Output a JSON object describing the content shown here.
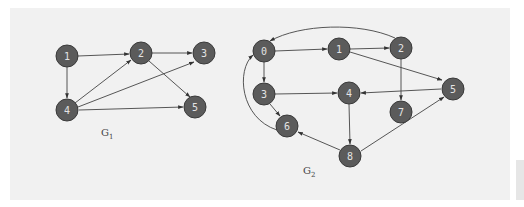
{
  "graphs": [
    {
      "id": "G1",
      "label": "G",
      "subscript": "1",
      "nodes": [
        {
          "id": "1",
          "x": 67,
          "y": 56
        },
        {
          "id": "2",
          "x": 141,
          "y": 53
        },
        {
          "id": "3",
          "x": 204,
          "y": 53
        },
        {
          "id": "4",
          "x": 67,
          "y": 110
        },
        {
          "id": "5",
          "x": 195,
          "y": 107
        }
      ],
      "edges": [
        {
          "from": "1",
          "to": "2"
        },
        {
          "from": "1",
          "to": "4"
        },
        {
          "from": "2",
          "to": "3"
        },
        {
          "from": "2",
          "to": "5"
        },
        {
          "from": "4",
          "to": "2"
        },
        {
          "from": "4",
          "to": "3"
        },
        {
          "from": "4",
          "to": "5"
        }
      ]
    },
    {
      "id": "G2",
      "label": "G",
      "subscript": "2",
      "nodes": [
        {
          "id": "0",
          "x": 264,
          "y": 51
        },
        {
          "id": "1",
          "x": 339,
          "y": 49
        },
        {
          "id": "2",
          "x": 401,
          "y": 48
        },
        {
          "id": "3",
          "x": 264,
          "y": 94
        },
        {
          "id": "4",
          "x": 349,
          "y": 93
        },
        {
          "id": "5",
          "x": 453,
          "y": 89
        },
        {
          "id": "6",
          "x": 287,
          "y": 126
        },
        {
          "id": "7",
          "x": 401,
          "y": 112
        },
        {
          "id": "8",
          "x": 350,
          "y": 156
        }
      ],
      "edges": [
        {
          "from": "0",
          "to": "1"
        },
        {
          "from": "0",
          "to": "3"
        },
        {
          "from": "1",
          "to": "2"
        },
        {
          "from": "1",
          "to": "5"
        },
        {
          "from": "2",
          "to": "0",
          "curved": true
        },
        {
          "from": "2",
          "to": "7"
        },
        {
          "from": "3",
          "to": "4"
        },
        {
          "from": "3",
          "to": "6"
        },
        {
          "from": "4",
          "to": "8"
        },
        {
          "from": "5",
          "to": "4"
        },
        {
          "from": "6",
          "to": "0",
          "curved": true
        },
        {
          "from": "8",
          "to": "6"
        },
        {
          "from": "8",
          "to": "5"
        }
      ]
    }
  ],
  "colors": {
    "node_fill": "#5b5b5b",
    "node_text": "#e4e4e4",
    "edge": "#444444",
    "background": "#f1f1f1"
  }
}
